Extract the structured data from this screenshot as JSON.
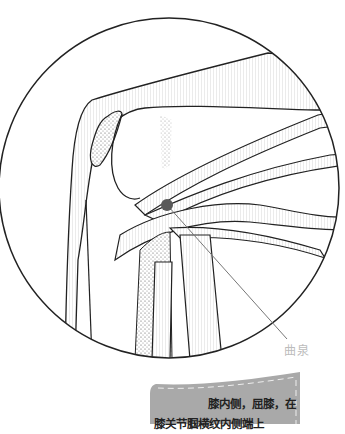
{
  "figure": {
    "acupoint_label": "曲泉",
    "acupoint_color": "#5a5a5a",
    "note": {
      "line1": "膝内侧，屈膝，在",
      "line2": "膝关节腘横纹内侧端上",
      "background": "#a9a9a9"
    }
  }
}
